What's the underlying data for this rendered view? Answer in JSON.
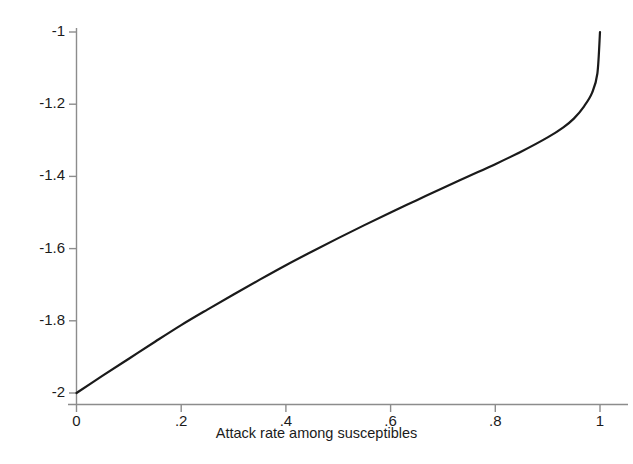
{
  "chart_data": {
    "type": "line",
    "title": "",
    "subtitle": "",
    "xlabel": "Attack rate among susceptibles",
    "ylabel": "",
    "xlim": [
      0,
      1
    ],
    "ylim": [
      -2,
      -1
    ],
    "grid": false,
    "legend": null,
    "xticks": [
      "0",
      ".2",
      ".4",
      ".6",
      ".8",
      "1"
    ],
    "xtick_values": [
      0,
      0.2,
      0.4,
      0.6,
      0.8,
      1
    ],
    "yticks": [
      "-1",
      "-1.2",
      "-1.4",
      "-1.6",
      "-1.8",
      "-2"
    ],
    "ytick_values": [
      -1,
      -1.2,
      -1.4,
      -1.6,
      -1.8,
      -2
    ],
    "series": [
      {
        "name": "curve",
        "color": "#1a1a1a",
        "linewidth": 2.2,
        "x": [
          0,
          0.05,
          0.1,
          0.15,
          0.2,
          0.25,
          0.3,
          0.35,
          0.4,
          0.45,
          0.5,
          0.55,
          0.6,
          0.65,
          0.7,
          0.75,
          0.8,
          0.85,
          0.9,
          0.93,
          0.95,
          0.97,
          0.985,
          0.995,
          1
        ],
        "values": [
          -2.0,
          -1.952,
          -1.905,
          -1.858,
          -1.812,
          -1.769,
          -1.727,
          -1.686,
          -1.646,
          -1.608,
          -1.571,
          -1.535,
          -1.5,
          -1.466,
          -1.432,
          -1.399,
          -1.366,
          -1.331,
          -1.292,
          -1.264,
          -1.24,
          -1.205,
          -1.168,
          -1.115,
          -1.0
        ]
      }
    ],
    "axis_color": "#8c8c8c",
    "text_color": "#1b1b1b",
    "background": "#ffffff"
  },
  "axes": {
    "x_axis_name": "x-axis",
    "y_axis_name": "y-axis"
  }
}
